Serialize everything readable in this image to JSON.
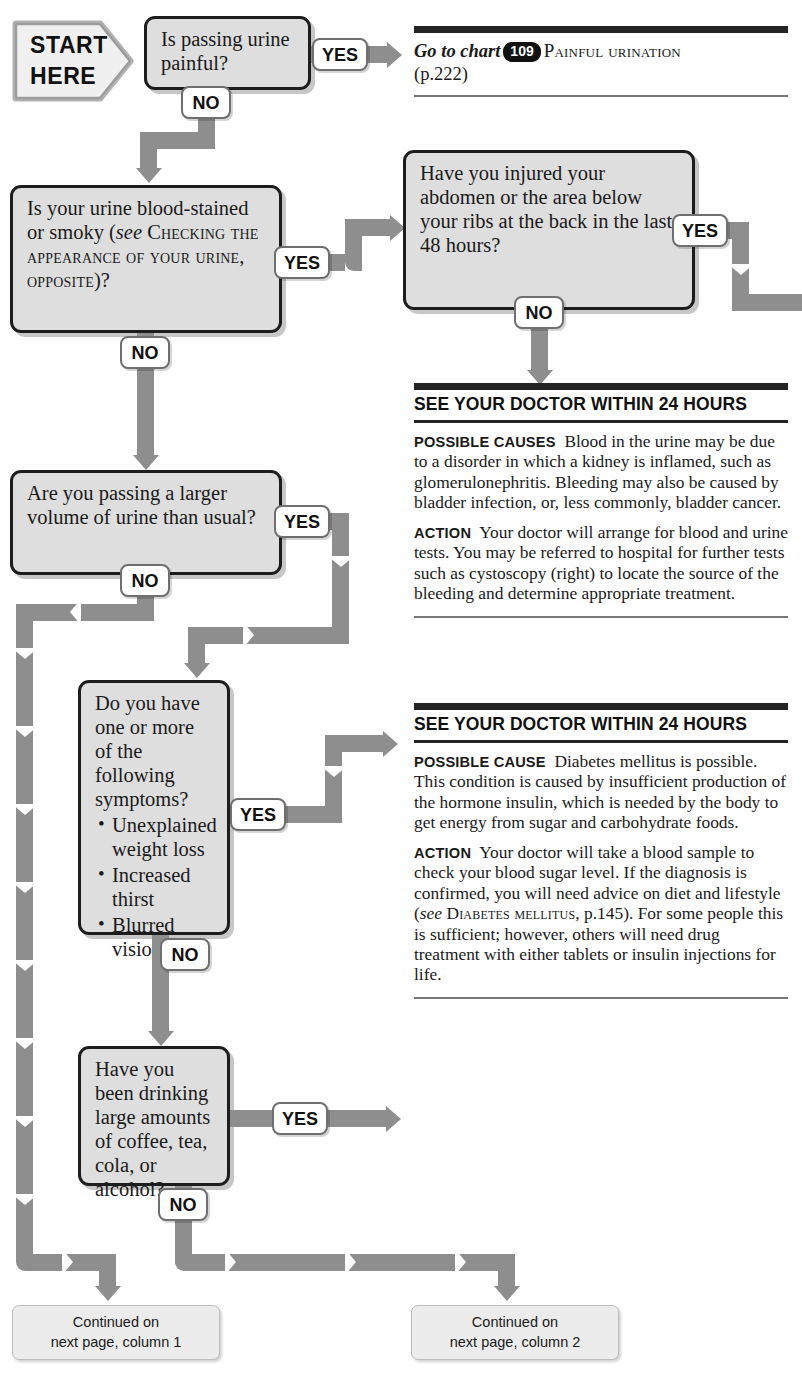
{
  "start": {
    "line1": "START",
    "line2": "HERE"
  },
  "labels": {
    "yes": "YES",
    "no": "NO"
  },
  "questions": [
    {
      "id": "q1",
      "text": "Is passing urine painful?"
    },
    {
      "id": "q2",
      "text_a": "Is your urine blood-stained or smoky (",
      "see": "see",
      "ref": "Checking the appearance of your urine, opposite",
      "text_b": ")?"
    },
    {
      "id": "q3",
      "text": "Have you injured your abdomen or the area below your ribs at the back in the last 48 hours?"
    },
    {
      "id": "q4",
      "text": "Are you passing a larger volume of urine than usual?"
    },
    {
      "id": "q5",
      "text": "Do you have one or more of the following symptoms?",
      "bullets": [
        "Unexplained weight loss",
        "Increased thirst",
        "Blurred vision"
      ]
    },
    {
      "id": "q6",
      "text": "Have you been drinking large amounts of coffee, tea, cola, or alcohol?"
    }
  ],
  "advice": {
    "goto": {
      "prefix": "Go to chart",
      "chart_number": "109",
      "chart_title": "Painful urination",
      "page": "(p.222)"
    },
    "block1": {
      "heading": "SEE YOUR DOCTOR WITHIN 24 HOURS",
      "cause_lead": "Possible causes",
      "cause_text": "Blood in the urine may be due to a disorder in which a kidney is inflamed, such as glomerulonephritis. Bleeding may also be caused by bladder infection, or, less commonly, bladder cancer.",
      "action_lead": "Action",
      "action_text": "Your doctor will arrange for blood and urine tests. You may be referred to hospital for further tests such as cystoscopy (right) to locate the source of the bleeding and determine appropriate treatment."
    },
    "block2": {
      "heading": "SEE YOUR DOCTOR WITHIN 24 HOURS",
      "cause_lead": "Possible cause",
      "cause_text": "Diabetes mellitus is possible. This condition is caused by insufficient production of the hormone insulin, which is needed by the body to get energy from sugar and carbohydrate foods.",
      "action_lead": "Action",
      "action_text_a": "Your doctor will take a blood sample to check your blood sugar level. If the diagnosis is confirmed, you will need advice on diet and lifestyle (",
      "action_see": "see",
      "action_ref": "Diabetes mellitus",
      "action_page": ", p.145",
      "action_text_b": "). For some people this is sufficient; however, others will need drug treatment with either tablets or insulin injections for life."
    },
    "block3": {
      "lead": "Possible cause and action",
      "text": "These drinks increase the amount of urine produced by the kidneys. Reduce your consumption of these fluids. Consult your doctor if you continue to pass large amounts of urine."
    }
  },
  "continued": [
    {
      "line1": "Continued on",
      "line2": "next page, column 1"
    },
    {
      "line1": "Continued on",
      "line2": "next page, column 2"
    }
  ],
  "colors": {
    "arrow": "#8e8e8e",
    "box_fill": "#dedede",
    "box_border": "#1d1d1d",
    "rule": "#252525"
  }
}
